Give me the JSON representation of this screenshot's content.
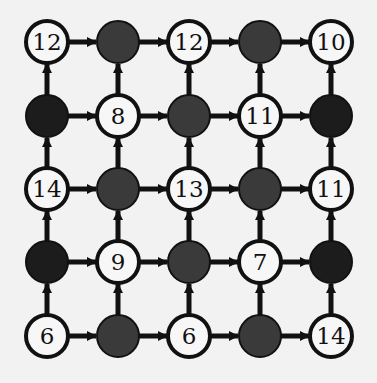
{
  "diagram": {
    "type": "directed-grid-graph",
    "rows": 5,
    "cols": 5,
    "edge_directions": [
      "right",
      "up"
    ],
    "colors": {
      "background": "#f2f2f2",
      "edge": "#111111",
      "node_open_fill": "#f7f7f7",
      "node_stroke": "#111111",
      "node_filled_dark": "#1c1c1c",
      "node_filled_mid": "#3a3a3a"
    },
    "nodes": [
      [
        {
          "label": "12",
          "filled": false
        },
        {
          "label": "",
          "filled": true,
          "shade": "mid"
        },
        {
          "label": "12",
          "filled": false
        },
        {
          "label": "",
          "filled": true,
          "shade": "mid"
        },
        {
          "label": "10",
          "filled": false
        }
      ],
      [
        {
          "label": "",
          "filled": true,
          "shade": "dark"
        },
        {
          "label": "8",
          "filled": false
        },
        {
          "label": "",
          "filled": true,
          "shade": "mid"
        },
        {
          "label": "11",
          "filled": false
        },
        {
          "label": "",
          "filled": true,
          "shade": "dark"
        }
      ],
      [
        {
          "label": "14",
          "filled": false
        },
        {
          "label": "",
          "filled": true,
          "shade": "mid"
        },
        {
          "label": "13",
          "filled": false
        },
        {
          "label": "",
          "filled": true,
          "shade": "mid"
        },
        {
          "label": "11",
          "filled": false
        }
      ],
      [
        {
          "label": "",
          "filled": true,
          "shade": "dark"
        },
        {
          "label": "9",
          "filled": false
        },
        {
          "label": "",
          "filled": true,
          "shade": "mid"
        },
        {
          "label": "7",
          "filled": false
        },
        {
          "label": "",
          "filled": true,
          "shade": "dark"
        }
      ],
      [
        {
          "label": "6",
          "filled": false
        },
        {
          "label": "",
          "filled": true,
          "shade": "mid"
        },
        {
          "label": "6",
          "filled": false
        },
        {
          "label": "",
          "filled": true,
          "shade": "mid"
        },
        {
          "label": "14",
          "filled": false
        }
      ]
    ]
  }
}
